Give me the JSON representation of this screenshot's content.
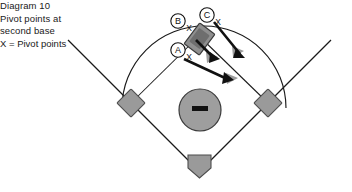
{
  "figure": {
    "title_line1": "Diagram 10",
    "title_line2": "Pivot points at",
    "title_line3": "second base",
    "legend": "X = Pivot points",
    "background_color": "#ffffff",
    "line_color": "#1a1a1a",
    "base_fill": "#9a9a9a",
    "base_stroke": "#4d4d4d",
    "mound_fill": "#9e9e9e",
    "mound_stroke": "#3a3a3a",
    "rubber_color": "#111111",
    "arrow_shaft_color": "#111111",
    "arrow_head_color": "#9c9c9c",
    "second_base_fill": "#8f8f8f",
    "second_base_overlay": "#6e6e6e"
  },
  "markers": [
    {
      "id": "A",
      "label": "A",
      "x_label": "X"
    },
    {
      "id": "B",
      "label": "B",
      "x_label": "X"
    },
    {
      "id": "C",
      "label": "C",
      "x_label": "X"
    }
  ],
  "field_elements": [
    {
      "name": "home-plate",
      "shape": "pentagon"
    },
    {
      "name": "first-base",
      "shape": "diamond"
    },
    {
      "name": "second-base",
      "shape": "rotated-rect"
    },
    {
      "name": "third-base",
      "shape": "diamond"
    },
    {
      "name": "pitchers-mound",
      "shape": "circle"
    },
    {
      "name": "pitching-rubber",
      "shape": "rect"
    },
    {
      "name": "outfield-arc",
      "shape": "arc"
    },
    {
      "name": "left-foul-line",
      "shape": "line"
    },
    {
      "name": "right-foul-line",
      "shape": "line"
    }
  ],
  "arrows": [
    {
      "name": "arrow-from-a",
      "from": "A",
      "direction": "down-right"
    },
    {
      "name": "arrow-from-b",
      "from": "B",
      "direction": "down-right"
    },
    {
      "name": "arrow-from-c",
      "from": "C",
      "direction": "down-right"
    }
  ]
}
